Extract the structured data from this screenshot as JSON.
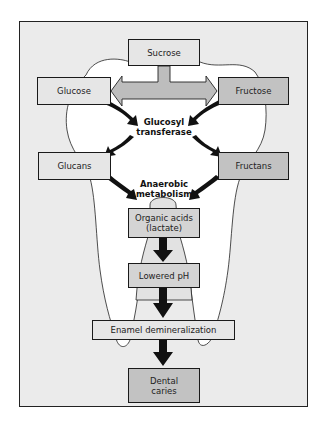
{
  "diagram": {
    "nodes": {
      "sucrose": "Sucrose",
      "glucose": "Glucose",
      "fructose": "Fructose",
      "glucans": "Glucans",
      "fructans": "Fructans",
      "organic_acids_line1": "Organic acids",
      "organic_acids_line2": "(lactate)",
      "lowered_ph": "Lowered pH",
      "enamel_demineralization": "Enamel demineralization",
      "dental_caries_line1": "Dental",
      "dental_caries_line2": "caries"
    },
    "process_labels": {
      "glucosyl_line1": "Glucosyl",
      "glucosyl_line2": "transferase",
      "anaerobic_line1": "Anaerobic",
      "anaerobic_line2": "metabolism"
    },
    "colors": {
      "frame_fill": "#ebebeb",
      "tooth_fill": "#ffffff",
      "box_light": "#e6e6e6",
      "box_mid": "#d4d4d4",
      "box_dark": "#c2c2c2",
      "arrow": "#111111",
      "split_arrow": "#bdbdbd"
    }
  }
}
